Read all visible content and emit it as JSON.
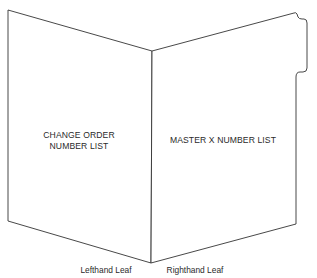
{
  "diagram": {
    "left_leaf": {
      "label_lines": [
        "CHANGE ORDER",
        "NUMBER LIST"
      ],
      "caption": "Lefthand Leaf"
    },
    "right_leaf": {
      "label_lines": [
        "MASTER X NUMBER LIST"
      ],
      "caption": "Righthand Leaf",
      "has_tab": true
    },
    "colors": {
      "line": "#333333",
      "text": "#2a2a2a",
      "background": "#ffffff"
    }
  }
}
